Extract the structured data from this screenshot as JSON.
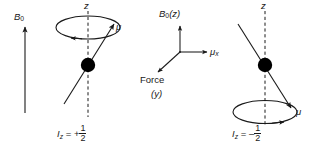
{
  "figure": {
    "background_color": "#ffffff",
    "stroke_color": "#1a1a1a",
    "nucleus_color": "#000000",
    "width": 325,
    "height": 151
  },
  "left_panel": {
    "field_label": "B",
    "field_sub": "0",
    "axis_label": "z",
    "moment_label": "μ",
    "spin_state": {
      "symbol": "I",
      "subscript": "z",
      "equals": "=",
      "sign": "+",
      "numerator": "1",
      "denominator": "2",
      "full": "Iz = +1/2"
    },
    "precession_sense": "counterclockwise"
  },
  "center_panel": {
    "z_axis_label": "B",
    "z_axis_sub": "0",
    "z_axis_paren": "(z)",
    "z_axis_full": "B0(z)",
    "x_axis_label": "μ",
    "x_axis_sub": "x",
    "x_axis_full": "μx",
    "force_label": "Force",
    "force_axis": "(y)"
  },
  "right_panel": {
    "axis_label": "z",
    "moment_label": "μ",
    "spin_state": {
      "symbol": "I",
      "subscript": "z",
      "equals": "=",
      "sign": "–",
      "numerator": "1",
      "denominator": "2",
      "full": "Iz = -1/2"
    },
    "precession_sense": "counterclockwise"
  }
}
